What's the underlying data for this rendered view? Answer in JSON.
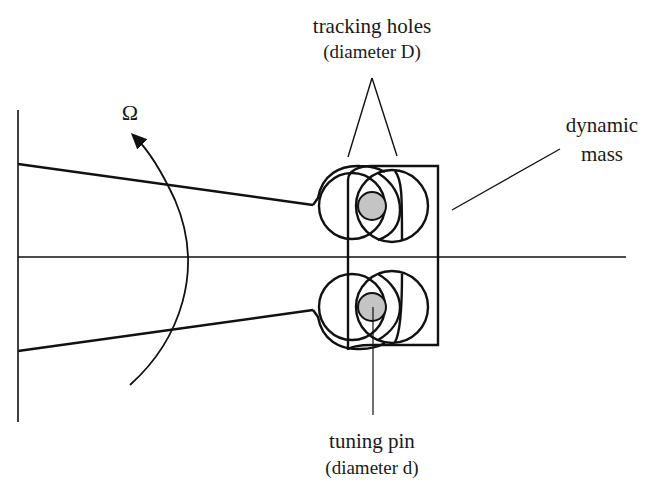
{
  "diagram": {
    "labels": {
      "tracking_holes": "tracking holes",
      "tracking_holes_sub": "(diameter D)",
      "dynamic_mass_line1": "dynamic",
      "dynamic_mass_line2": "mass",
      "tuning_pin": "tuning pin",
      "tuning_pin_sub": "(diameter d)",
      "rotation_symbol": "Ω"
    },
    "colors": {
      "stroke": "#111111",
      "pin_fill": "#c4c4c4",
      "background": "#ffffff"
    },
    "components": [
      "base-wall",
      "axis-line",
      "tapered-arm",
      "dynamic-mass",
      "upper-tracking-hole",
      "lower-tracking-hole",
      "upper-tuning-pin",
      "lower-tuning-pin",
      "rotation-arrow"
    ]
  }
}
